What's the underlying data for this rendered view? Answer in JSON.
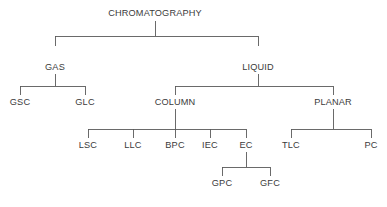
{
  "diagram": {
    "type": "hierarchy-tree",
    "colors": {
      "background": "#ffffff",
      "text": "#3b3b3b",
      "line": "#5a5a5a"
    },
    "nodes": [
      {
        "id": "chromatography",
        "label": "CHROMATOGRAPHY",
        "level": 0,
        "x": 155,
        "y": 14
      },
      {
        "id": "gas",
        "label": "GAS",
        "level": 1,
        "x": 55,
        "y": 68
      },
      {
        "id": "liquid",
        "label": "LIQUID",
        "level": 1,
        "x": 258,
        "y": 68
      },
      {
        "id": "gsc",
        "label": "GSC",
        "level": 2,
        "x": 20,
        "y": 103
      },
      {
        "id": "glc",
        "label": "GLC",
        "level": 2,
        "x": 85,
        "y": 103
      },
      {
        "id": "column",
        "label": "COLUMN",
        "level": 2,
        "x": 175,
        "y": 103
      },
      {
        "id": "planar",
        "label": "PLANAR",
        "level": 2,
        "x": 333,
        "y": 103
      },
      {
        "id": "lsc",
        "label": "LSC",
        "level": 3,
        "x": 88,
        "y": 146
      },
      {
        "id": "llc",
        "label": "LLC",
        "level": 3,
        "x": 133,
        "y": 146
      },
      {
        "id": "bpc",
        "label": "BPC",
        "level": 3,
        "x": 175,
        "y": 146
      },
      {
        "id": "iec",
        "label": "IEC",
        "level": 3,
        "x": 210,
        "y": 146
      },
      {
        "id": "ec",
        "label": "EC",
        "level": 3,
        "x": 246,
        "y": 146
      },
      {
        "id": "tlc",
        "label": "TLC",
        "level": 3,
        "x": 291,
        "y": 146
      },
      {
        "id": "pc",
        "label": "PC",
        "level": 3,
        "x": 371,
        "y": 146
      },
      {
        "id": "gpc",
        "label": "GPC",
        "level": 4,
        "x": 222,
        "y": 184
      },
      {
        "id": "gfc",
        "label": "GFC",
        "level": 4,
        "x": 270,
        "y": 184
      }
    ],
    "edges": [
      {
        "parent": "chromatography",
        "children": [
          "gas",
          "liquid"
        ]
      },
      {
        "parent": "gas",
        "children": [
          "gsc",
          "glc"
        ]
      },
      {
        "parent": "liquid",
        "children": [
          "column",
          "planar"
        ]
      },
      {
        "parent": "column",
        "children": [
          "lsc",
          "llc",
          "bpc",
          "iec",
          "ec"
        ]
      },
      {
        "parent": "planar",
        "children": [
          "tlc",
          "pc"
        ]
      },
      {
        "parent": "ec",
        "children": [
          "gpc",
          "gfc"
        ]
      }
    ],
    "labels": {
      "root": "CHROMATOGRAPHY",
      "gas": "GAS",
      "liquid": "LIQUID",
      "gsc": "GSC",
      "glc": "GLC",
      "column": "COLUMN",
      "planar": "PLANAR",
      "lsc": "LSC",
      "llc": "LLC",
      "bpc": "BPC",
      "iec": "IEC",
      "ec": "EC",
      "tlc": "TLC",
      "pc": "PC",
      "gpc": "GPC",
      "gfc": "GFC"
    }
  }
}
